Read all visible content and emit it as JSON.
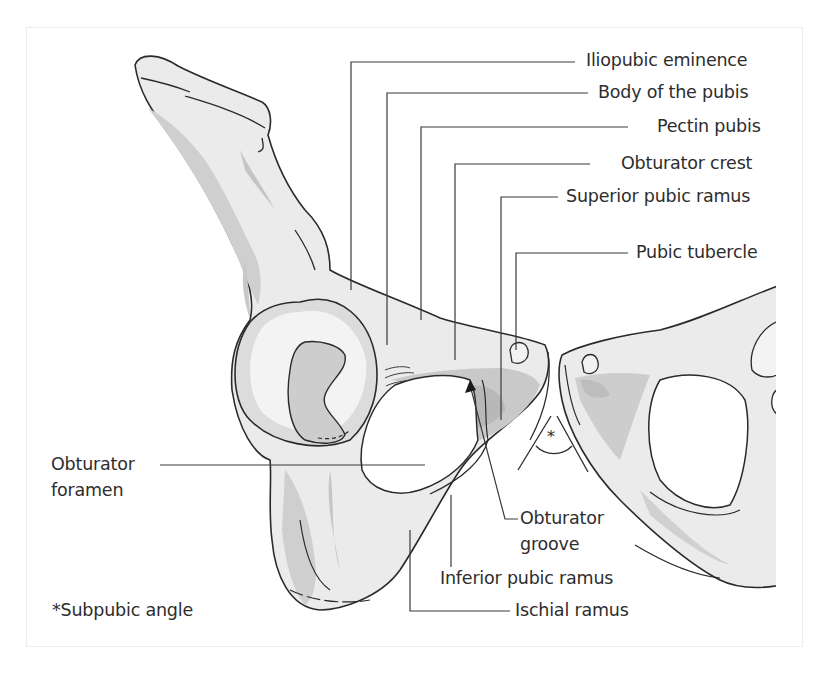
{
  "figure": {
    "colors": {
      "bone_light": "#eeeeee",
      "bone_mid": "#d6d6d6",
      "bone_dark": "#bdbdbd",
      "outline": "#2a2a2a",
      "leader_line": "#3a3a3a",
      "frame": "#ececec"
    }
  },
  "labels": {
    "iliopubic_eminence": "Iliopubic eminence",
    "body_of_pubis": "Body of the pubis",
    "pectin_pubis": "Pectin pubis",
    "obturator_crest": "Obturator crest",
    "superior_pubic_ramus": "Superior pubic ramus",
    "pubic_tubercle": "Pubic tubercle",
    "obturator_foramen_line1": "Obturator",
    "obturator_foramen_line2": "foramen",
    "obturator_groove_line1": "Obturator",
    "obturator_groove_line2": "groove",
    "inferior_pubic_ramus": "Inferior pubic ramus",
    "ischial_ramus": "Ischial ramus",
    "angle_marker": "*"
  },
  "legend": {
    "symbol": "*",
    "text": "Subpubic angle"
  }
}
